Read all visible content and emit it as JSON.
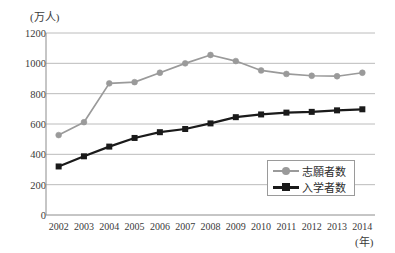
{
  "chart_data": {
    "type": "line",
    "title": "",
    "xlabel": "(年)",
    "ylabel": "(万人)",
    "ylim": [
      0,
      1200
    ],
    "yticks": [
      0,
      200,
      400,
      600,
      800,
      1000,
      1200
    ],
    "ytick_labels": [
      "0",
      "200",
      "400",
      "600",
      "800",
      "1000",
      "1200"
    ],
    "grid": true,
    "legend_position": "bottom-right",
    "categories": [
      "2002",
      "2003",
      "2004",
      "2005",
      "2006",
      "2007",
      "2008",
      "2009",
      "2010",
      "2011",
      "2012",
      "2013",
      "2014"
    ],
    "series": [
      {
        "name": "志願者数",
        "color": "#9a9a9a",
        "marker": "circle",
        "values": [
          527,
          612,
          868,
          876,
          938,
          1000,
          1055,
          1015,
          953,
          930,
          918,
          915,
          938
        ]
      },
      {
        "name": "入学者数",
        "color": "#1a1a1a",
        "marker": "square",
        "values": [
          320,
          387,
          451,
          508,
          546,
          567,
          604,
          645,
          663,
          675,
          680,
          690,
          697
        ]
      }
    ]
  },
  "axes": {
    "y_unit_label": "(万人)",
    "x_unit_label": "(年)"
  },
  "legend": {
    "items": [
      {
        "label": "志願者数"
      },
      {
        "label": "入学者数"
      }
    ]
  },
  "layout": {
    "plot_left": 46,
    "plot_right": 375,
    "plot_top": 33,
    "plot_bottom": 215
  }
}
